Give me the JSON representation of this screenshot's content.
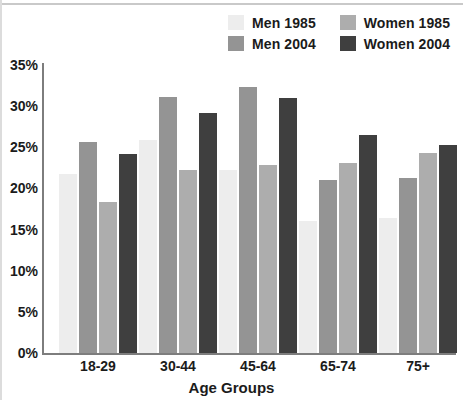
{
  "chart_data": {
    "type": "bar",
    "title": "",
    "subtitle": "",
    "xlabel": "Age Groups",
    "ylabel": "",
    "categories": [
      "18-29",
      "30-44",
      "45-64",
      "65-74",
      "75+"
    ],
    "series": [
      {
        "name": "Men 1985",
        "color": "#ededed",
        "values": [
          21.7,
          25.9,
          22.3,
          16.0,
          16.4
        ]
      },
      {
        "name": "Men 2004",
        "color": "#949494",
        "values": [
          25.7,
          31.1,
          32.3,
          21.0,
          21.3
        ]
      },
      {
        "name": "Women 1985",
        "color": "#adadad",
        "values": [
          18.3,
          22.2,
          22.8,
          23.1,
          24.3
        ]
      },
      {
        "name": "Women 2004",
        "color": "#3f3f3f",
        "values": [
          24.2,
          29.2,
          31.0,
          26.5,
          25.3
        ]
      }
    ],
    "ylim": [
      0,
      35
    ],
    "ytick_labels": [
      "0%",
      "5%",
      "10%",
      "15%",
      "20%",
      "25%",
      "30%",
      "35%"
    ],
    "ytick_values": [
      0,
      5,
      10,
      15,
      20,
      25,
      30,
      35
    ],
    "grid": false,
    "legend_position": "top-right"
  },
  "legend": {
    "items": [
      {
        "label": "Men 1985",
        "color": "#ededed"
      },
      {
        "label": "Women 1985",
        "color": "#adadad"
      },
      {
        "label": "Men 2004",
        "color": "#949494"
      },
      {
        "label": "Women 2004",
        "color": "#3f3f3f"
      }
    ]
  },
  "axis": {
    "x_title": "Age Groups",
    "axis_color": "#7d7d7d"
  }
}
